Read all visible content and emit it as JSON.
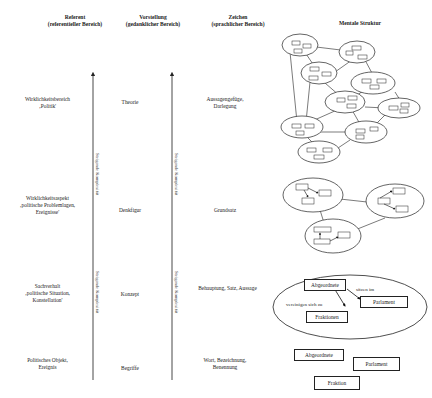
{
  "headers": {
    "referent": {
      "title": "Referent",
      "sub": "(referentieller Bereich)"
    },
    "vorstellung": {
      "title": "Vorstellung",
      "sub": "(gedanklicher Bereich)"
    },
    "zeichen": {
      "title": "Zeichen",
      "sub": "(sprachlicher Bereich)"
    },
    "mental": {
      "title": "Mentale Struktur"
    }
  },
  "rows": [
    {
      "referent": [
        "Wirklichkeitsbereich",
        "‚Politik'"
      ],
      "vorstellung": "Theorie",
      "zeichen": [
        "Aussagengefüge,",
        "Darlegung"
      ]
    },
    {
      "referent": [
        "Wirklichkeitsaspekt",
        "‚politische Problemlagen,",
        "Ereignisse'"
      ],
      "vorstellung": "Denkfigur",
      "zeichen": [
        "Grundsatz"
      ]
    },
    {
      "referent": [
        "Sachverhalt",
        "‚politische Situation,",
        "Konstellation'"
      ],
      "vorstellung": "Konzept",
      "zeichen": [
        "Behauptung, Satz, Aussage"
      ]
    },
    {
      "referent": [
        "Politisches Objekt,",
        "Ereignis"
      ],
      "vorstellung": "Begriffe",
      "zeichen": [
        "Wort, Bezeichnung,",
        "Benennung"
      ]
    }
  ],
  "axis_label": "Steigende Komplexität",
  "concept_map": {
    "nodes": [
      "Abgeordnete",
      "Parlament",
      "Fraktionen"
    ],
    "edges": [
      "sitzen im",
      "vereinigen sich zu"
    ]
  },
  "word_boxes": [
    "Abgeordnete",
    "Parlament",
    "Fraktion"
  ]
}
